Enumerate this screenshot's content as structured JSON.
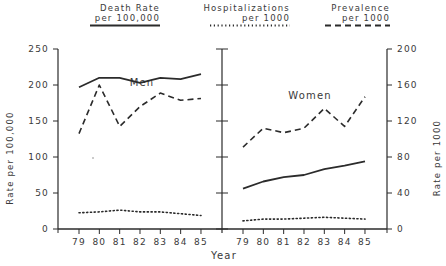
{
  "chart_data": {
    "type": "line",
    "xlabel": "Year",
    "ylabel_left": "Rate per 100,000",
    "ylabel_right": "Rate per 1000",
    "ylim_left": [
      0,
      250
    ],
    "ylim_right": [
      0,
      200
    ],
    "yticks_left": [
      0,
      50,
      100,
      150,
      200,
      250
    ],
    "yticks_right": [
      0,
      40,
      80,
      120,
      160,
      200
    ],
    "categories": [
      "79",
      "80",
      "81",
      "82",
      "83",
      "84",
      "85"
    ],
    "legend": [
      {
        "name": "Death Rate per 100,000",
        "line1": "Death Rate",
        "line2": "per 100,000",
        "style": "solid",
        "axis": "left"
      },
      {
        "name": "Hospitalizations per 1000",
        "line1": "Hospitalizations",
        "line2": "per 1000",
        "style": "dotted",
        "axis": "right"
      },
      {
        "name": "Prevalence per 1000",
        "line1": "Prevalence",
        "line2": "per 1000",
        "style": "dashed",
        "axis": "right"
      }
    ],
    "legend_position": "top",
    "grid": false,
    "panels": [
      {
        "title": "Men",
        "series": [
          {
            "name": "Death Rate per 100,000",
            "axis": "left",
            "style": "solid",
            "values": [
              197,
              210,
              210,
              203,
              210,
              208,
              215
            ]
          },
          {
            "name": "Hospitalizations per 1000",
            "axis": "right",
            "style": "dotted",
            "values": [
              18,
              19,
              21,
              19,
              19,
              17,
              15
            ]
          },
          {
            "name": "Prevalence per 1000",
            "axis": "right",
            "style": "dashed",
            "values": [
              106,
              160,
              114,
              136,
              151,
              143,
              145
            ]
          }
        ]
      },
      {
        "title": "Women",
        "series": [
          {
            "name": "Death Rate per 100,000",
            "axis": "left",
            "style": "solid",
            "values": [
              56,
              66,
              72,
              75,
              83,
              88,
              94
            ]
          },
          {
            "name": "Hospitalizations per 1000",
            "axis": "right",
            "style": "dotted",
            "values": [
              9,
              11,
              11,
              12,
              13,
              12,
              11
            ]
          },
          {
            "name": "Prevalence per 1000",
            "axis": "right",
            "style": "dashed",
            "values": [
              91,
              112,
              107,
              112,
              134,
              114,
              147
            ]
          }
        ]
      }
    ]
  }
}
